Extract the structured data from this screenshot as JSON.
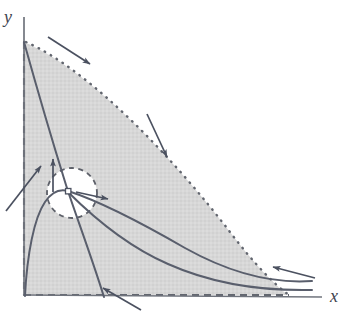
{
  "figure": {
    "kind": "phase-plane-diagram",
    "background_color": "#ffffff",
    "axes": {
      "x_label": "x",
      "y_label": "y",
      "x_label_pos": [
        331,
        301
      ],
      "y_label_pos": [
        4,
        22
      ],
      "axis_color": "#6b7280",
      "origin": [
        24,
        295
      ],
      "x_axis_end": [
        322,
        295
      ],
      "y_axis_top": [
        24,
        17
      ]
    },
    "region": {
      "name": "invariant-shaded-region",
      "fill_color": "#d6d6d6",
      "left_edge": {
        "style": "dashed",
        "from": [
          24,
          42
        ],
        "to": [
          24,
          295
        ]
      },
      "bottom_edge": {
        "style": "dashed",
        "from": [
          24,
          295
        ],
        "to": [
          288,
          295
        ]
      },
      "hypotenuse": {
        "style": "dotted",
        "from": [
          26,
          42
        ],
        "to": [
          288,
          295
        ],
        "curvature": "convex-outward"
      },
      "hole": {
        "name": "excised-disk",
        "style": "dashed",
        "center": [
          72,
          193
        ],
        "radius": 25,
        "fill_color": "#ffffff"
      }
    },
    "equilibrium": {
      "name": "saddle-point",
      "pos": [
        68,
        191
      ],
      "marker": "open-square",
      "size": 5
    },
    "trajectories": [
      {
        "name": "steep-descending-separatrix",
        "color": "#5a5f6e"
      },
      {
        "name": "rising-separatrix-from-origin",
        "color": "#5a5f6e"
      },
      {
        "name": "upper-outflow-curve",
        "color": "#5a5f6e"
      },
      {
        "name": "lower-outflow-curve",
        "color": "#5a5f6e"
      }
    ],
    "arrows": [
      {
        "name": "arrow-top-inward",
        "from": [
          48,
          38
        ],
        "to": [
          92,
          66
        ]
      },
      {
        "name": "arrow-hypotenuse-inward",
        "from": [
          148,
          115
        ],
        "to": [
          168,
          160
        ]
      },
      {
        "name": "arrow-left-edge-inward",
        "from": [
          6,
          210
        ],
        "to": [
          42,
          165
        ]
      },
      {
        "name": "arrow-hole-upward",
        "from": [
          54,
          190
        ],
        "to": [
          53,
          158
        ]
      },
      {
        "name": "arrow-hole-rightward",
        "from": [
          76,
          192
        ],
        "to": [
          110,
          200
        ]
      },
      {
        "name": "arrow-bottom-inward",
        "from": [
          140,
          310
        ],
        "to": [
          102,
          288
        ]
      },
      {
        "name": "arrow-right-outflow",
        "from": [
          314,
          277
        ],
        "to": [
          272,
          266
        ]
      }
    ]
  }
}
